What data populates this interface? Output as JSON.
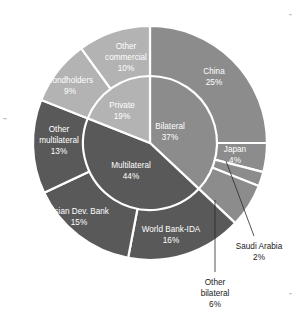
{
  "chart_data": {
    "type": "pie",
    "title": "",
    "subtitle": "",
    "xlabel": "",
    "ylabel": "",
    "legend_position": "none",
    "grid": false,
    "variant": "nested-donut",
    "rings": [
      {
        "name": "inner",
        "label": "Creditor category",
        "categories": [
          "Bilateral",
          "Multilateral",
          "Private"
        ],
        "values": [
          37,
          44,
          19
        ],
        "value_labels": [
          "37%",
          "44%",
          "19%"
        ],
        "colors": [
          "#8c8c8c",
          "#595959",
          "#b3b3b3"
        ]
      },
      {
        "name": "outer",
        "label": "Creditor detail",
        "categories": [
          "China",
          "Japan",
          "Saudi Arabia",
          "Other bilateral",
          "World Bank-IDA",
          "Asian Dev. Bank",
          "Other multilateral",
          "Bondholders",
          "Other commercial"
        ],
        "values": [
          25,
          4,
          2,
          6,
          16,
          15,
          13,
          9,
          10
        ],
        "value_labels": [
          "25%",
          "4%",
          "2%",
          "6%",
          "16%",
          "15%",
          "13%",
          "9%",
          "10%"
        ],
        "colors": [
          "#8c8c8c",
          "#8c8c8c",
          "#8c8c8c",
          "#8c8c8c",
          "#595959",
          "#595959",
          "#595959",
          "#b3b3b3",
          "#b3b3b3"
        ],
        "parents": [
          "Bilateral",
          "Bilateral",
          "Bilateral",
          "Bilateral",
          "Multilateral",
          "Multilateral",
          "Multilateral",
          "Private",
          "Private"
        ]
      }
    ]
  },
  "inner_slices": [
    {
      "name": "Bilateral",
      "pct": "37%"
    },
    {
      "name": "Multilateral",
      "pct": "44%"
    },
    {
      "name": "Private",
      "pct": "19%"
    }
  ],
  "outer_slices": [
    {
      "name": "China",
      "pct": "25%"
    },
    {
      "name": "Japan",
      "pct": "4%"
    },
    {
      "name": "Saudi Arabia",
      "pct": "2%"
    },
    {
      "name": "Other bilateral",
      "pct": "6%"
    },
    {
      "name": "World Bank-IDA",
      "pct": "16%"
    },
    {
      "name": "Asian Dev. Bank",
      "pct": "15%"
    },
    {
      "name": "Other multilateral",
      "pct": "13%"
    },
    {
      "name": "Bondholders",
      "pct": "9%"
    },
    {
      "name": "Other commercial",
      "pct": "10%"
    }
  ],
  "labels": {
    "china_l1": "China",
    "china_l2": "25%",
    "japan_l1": "Japan",
    "japan_l2": "4%",
    "saudi_l1": "Saudi Arabia",
    "saudi_l2": "2%",
    "other_bilateral_l1": "Other",
    "other_bilateral_l2": "bilateral",
    "other_bilateral_l3": "6%",
    "wb_l1": "World Bank-IDA",
    "wb_l2": "16%",
    "adb_l1": "Asian Dev. Bank",
    "adb_l2": "15%",
    "other_multi_l1": "Other",
    "other_multi_l2": "multilateral",
    "other_multi_l3": "13%",
    "bondholders_l1": "Bondholders",
    "bondholders_l2": "9%",
    "other_comm_l1": "Other",
    "other_comm_l2": "commercial",
    "other_comm_l3": "10%",
    "bilateral_l1": "Bilateral",
    "bilateral_l2": "37%",
    "multilateral_l1": "Multilateral",
    "multilateral_l2": "44%",
    "private_l1": "Private",
    "private_l2": "19%"
  },
  "colors": {
    "bilateral": "#8c8c8c",
    "multilateral": "#595959",
    "private": "#b3b3b3",
    "separator": "#ffffff",
    "background": "#ffffff",
    "callout_text": "#1a1a1a",
    "leader_line": "#2a2a2a"
  }
}
